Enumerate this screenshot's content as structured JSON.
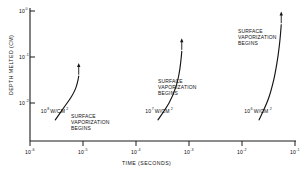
{
  "chart_data": {
    "type": "line",
    "title": "",
    "xlabel": "TIME (SECONDS)",
    "ylabel": "DEPTH MELTED (CM)",
    "xscale": "log",
    "yscale": "log",
    "xlim": [
      1e-06,
      0.1
    ],
    "ylim": [
      0.001,
      1
    ],
    "grid": false,
    "legend": "none",
    "xticks": [
      {
        "label_base": "10",
        "label_exp": "-6",
        "value": 1e-06
      },
      {
        "label_base": "10",
        "label_exp": "-5",
        "value": 1e-05
      },
      {
        "label_base": "10",
        "label_exp": "-4",
        "value": 0.0001
      },
      {
        "label_base": "10",
        "label_exp": "-3",
        "value": 0.001
      },
      {
        "label_base": "10",
        "label_exp": "-2",
        "value": 0.01
      },
      {
        "label_base": "10",
        "label_exp": "-1",
        "value": 0.1
      }
    ],
    "yticks": [
      {
        "label_base": "10",
        "label_exp": "0",
        "value": 1
      },
      {
        "label_base": "10",
        "label_exp": "-1",
        "value": 0.1
      },
      {
        "label_base": "10",
        "label_exp": "-2",
        "value": 0.01
      }
    ],
    "series": [
      {
        "name": "10^8 W/CM^2",
        "power_base": "10",
        "power_exp": "8",
        "power_units": "W/CM",
        "power_units_exp": "2",
        "label_x": 1.6e-06,
        "label_y": 0.0042,
        "annotation": "SURFACE VAPORIZATION BEGINS",
        "points": [
          {
            "x": 3e-06,
            "y": 0.003
          },
          {
            "x": 4.5e-06,
            "y": 0.006
          },
          {
            "x": 6e-06,
            "y": 0.0098
          },
          {
            "x": 7.2e-06,
            "y": 0.015
          },
          {
            "x": 7.9e-06,
            "y": 0.0215
          },
          {
            "x": 8.3e-06,
            "y": 0.029
          }
        ]
      },
      {
        "name": "10^7 W/CM^2",
        "power_base": "10",
        "power_exp": "7",
        "power_units": "W/CM",
        "power_units_exp": "2",
        "label_x": 0.00015,
        "label_y": 0.0042,
        "annotation": "SURFACE VAPORIZATION BEGINS",
        "points": [
          {
            "x": 0.00026,
            "y": 0.003
          },
          {
            "x": 0.00042,
            "y": 0.0072
          },
          {
            "x": 0.00056,
            "y": 0.016
          },
          {
            "x": 0.00065,
            "y": 0.033
          },
          {
            "x": 0.0007,
            "y": 0.062
          },
          {
            "x": 0.00073,
            "y": 0.105
          }
        ]
      },
      {
        "name": "10^6 W/CM^2",
        "power_base": "10",
        "power_exp": "6",
        "power_units": "W/CM",
        "power_units_exp": "2",
        "label_x": 0.011,
        "label_y": 0.0042,
        "annotation": "SURFACE VAPORIZATION BEGINS",
        "points": [
          {
            "x": 0.021,
            "y": 0.003
          },
          {
            "x": 0.031,
            "y": 0.0085
          },
          {
            "x": 0.04,
            "y": 0.025
          },
          {
            "x": 0.047,
            "y": 0.072
          },
          {
            "x": 0.052,
            "y": 0.19
          },
          {
            "x": 0.055,
            "y": 0.42
          }
        ]
      }
    ]
  }
}
